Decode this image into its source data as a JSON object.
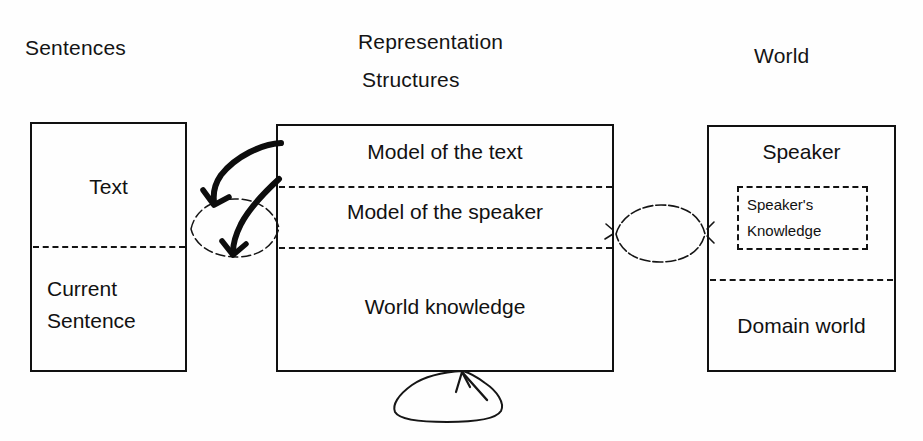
{
  "diagram": {
    "background_color": "#fefefe",
    "stroke_color": "#111111",
    "headers": {
      "left": "Sentences",
      "middle_line1": "Representation",
      "middle_line2": "Structures",
      "right": "World"
    },
    "columns": [
      {
        "name": "sentences",
        "header": "Sentences",
        "cells": [
          {
            "label": "Text"
          },
          {
            "label_line1": "Current",
            "label_line2": "Sentence"
          }
        ]
      },
      {
        "name": "representation-structures",
        "header": "Representation Structures",
        "cells": [
          {
            "label": "Model of the text"
          },
          {
            "label": "Model of the speaker"
          },
          {
            "label": "World knowledge"
          }
        ]
      },
      {
        "name": "world",
        "header": "World",
        "cells": [
          {
            "label": "Speaker",
            "inner": {
              "line1": "Speaker's",
              "line2": "Knowledge"
            }
          },
          {
            "label": "Domain world"
          }
        ]
      }
    ],
    "connectors": [
      {
        "name": "left-lens",
        "kind": "ellipse",
        "between": [
          "Text / Current Sentence",
          "Model of the text / Model of the speaker"
        ]
      },
      {
        "name": "arrow-upper",
        "kind": "curved-arrow",
        "from": "Model of the text",
        "to": "Text"
      },
      {
        "name": "arrow-lower",
        "kind": "curved-arrow",
        "from": "Model of the speaker",
        "to": "Current Sentence"
      },
      {
        "name": "right-lens",
        "kind": "ellipse",
        "between": [
          "Model of the speaker",
          "Speaker's Knowledge"
        ]
      },
      {
        "name": "bottom-blob",
        "kind": "cloud-arrow",
        "from": "Domain world",
        "to": "World knowledge"
      }
    ]
  }
}
